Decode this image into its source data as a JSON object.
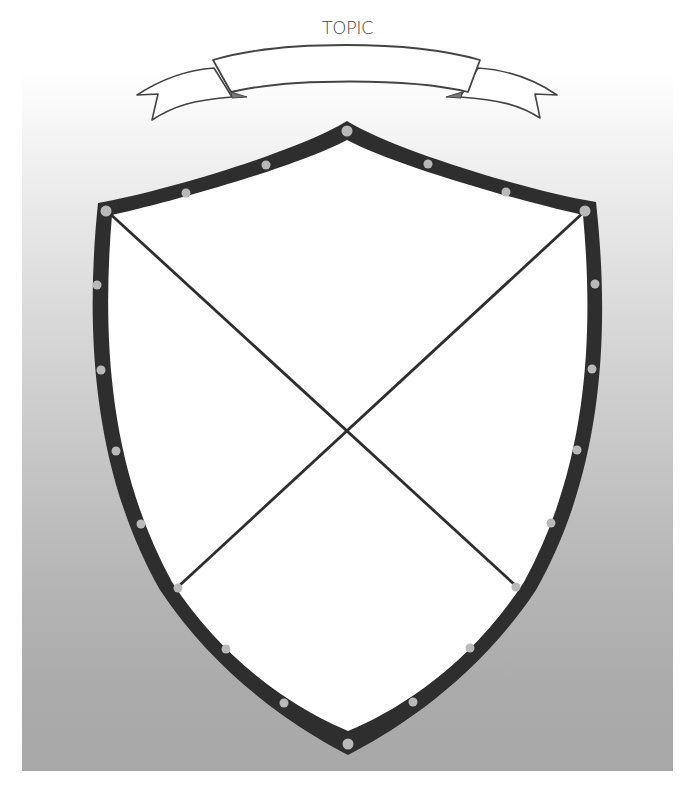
{
  "title": "TOPIC",
  "banner": {
    "text": "",
    "fill": "#ffffff",
    "stroke": "#444444",
    "fold_color": "#7a7a7a"
  },
  "shield": {
    "border_color": "#2e2e2e",
    "fill": "#ffffff",
    "rivet_color": "#b9b9b9",
    "divider_color": "#2e2e2e",
    "quadrants": [
      {
        "position": "top",
        "text": ""
      },
      {
        "position": "left",
        "text": ""
      },
      {
        "position": "right",
        "text": ""
      },
      {
        "position": "bottom",
        "text": ""
      }
    ]
  },
  "background": {
    "top_color": "#ffffff",
    "bottom_color": "#a8a8a8"
  }
}
